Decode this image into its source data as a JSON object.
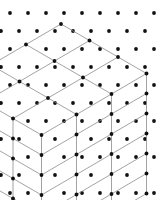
{
  "figure": {
    "type": "isometric-lattice-diagram",
    "width": 161,
    "height": 200,
    "background_color": "#ffffff"
  },
  "style": {
    "edge_color": "#8c8c8c",
    "edge_width": 0.8,
    "node_color": "#111111",
    "node_radius": 1.9,
    "background_node_color": "#111111",
    "background_node_radius": 1.9
  },
  "chart_data": {
    "type": "scatter",
    "projection": {
      "origin_x": 61,
      "origin_y": 24,
      "axis_a_dx": 28.5,
      "axis_a_dy": 16.5,
      "axis_b_dx": -35.0,
      "axis_b_dy": 20.5,
      "axis_c_dx": 0,
      "axis_c_dy": 20.0
    },
    "lattice": {
      "nx": 3,
      "ny": 3,
      "nz": 6,
      "nodes_x": 4,
      "nodes_y": 4,
      "nodes_z": 7,
      "visible_node_count": 64
    },
    "background_grid": {
      "spacing_x": 18.0,
      "spacing_y": 18.0,
      "stagger_x": 9.0,
      "stagger_y": 9.0,
      "origin_x": 10.0,
      "origin_y": 13.0,
      "columns": 9,
      "rows": 12
    },
    "xlabel": "",
    "ylabel": "",
    "grid": false,
    "legend": null
  }
}
